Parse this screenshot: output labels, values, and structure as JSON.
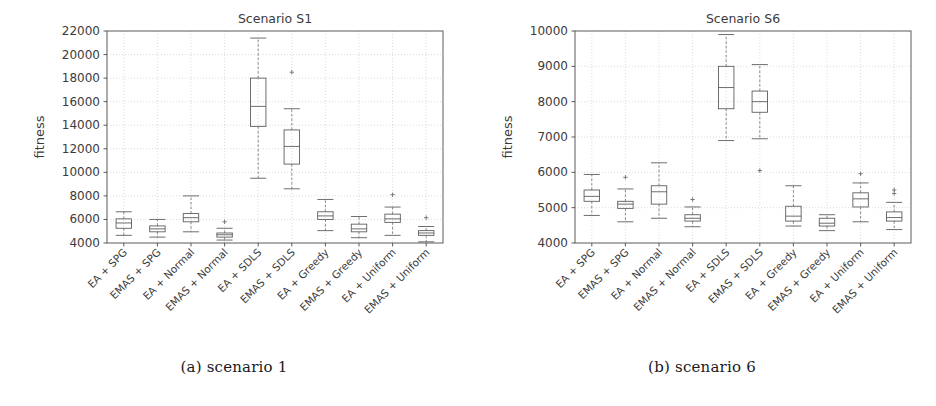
{
  "figure": {
    "panels": [
      {
        "id": "a",
        "caption": "(a) scenario 1",
        "chart_key": "0"
      },
      {
        "id": "b",
        "caption": "(b) scenario 6",
        "chart_key": "1"
      }
    ]
  },
  "chart_data": [
    {
      "type": "box",
      "title": "Scenario S1",
      "xlabel": "",
      "ylabel": "fitness",
      "ylim": [
        4000,
        22000
      ],
      "yticks": [
        4000,
        6000,
        8000,
        10000,
        12000,
        14000,
        16000,
        18000,
        20000,
        22000
      ],
      "ytick_labels": [
        "4000",
        "6000",
        "8000",
        "10000",
        "12000",
        "14000",
        "16000",
        "18000",
        "20000",
        "22000"
      ],
      "grid": true,
      "legend": "none",
      "categories": [
        "EA + SPG",
        "EMAS + SPG",
        "EA + Normal",
        "EMAS + Normal",
        "EA + SDLS",
        "EMAS + SDLS",
        "EA + Greedy",
        "EMAS + Greedy",
        "EA + Uniform",
        "EMAS + Uniform"
      ],
      "boxes": [
        {
          "category": "EA + SPG",
          "whisker_low": 4650,
          "q1": 5250,
          "median": 5700,
          "q3": 6050,
          "whisker_high": 6650,
          "outliers": []
        },
        {
          "category": "EMAS + SPG",
          "whisker_low": 4500,
          "q1": 4950,
          "median": 5200,
          "q3": 5450,
          "whisker_high": 6000,
          "outliers": []
        },
        {
          "category": "EA + Normal",
          "whisker_low": 4950,
          "q1": 5800,
          "median": 6150,
          "q3": 6500,
          "whisker_high": 8000,
          "outliers": []
        },
        {
          "category": "EMAS + Normal",
          "whisker_low": 4250,
          "q1": 4500,
          "median": 4700,
          "q3": 4850,
          "whisker_high": 5250,
          "outliers": [
            5800
          ]
        },
        {
          "category": "EA + SDLS",
          "whisker_low": 9500,
          "q1": 13900,
          "median": 15600,
          "q3": 18000,
          "whisker_high": 21400,
          "outliers": []
        },
        {
          "category": "EMAS + SDLS",
          "whisker_low": 8600,
          "q1": 10700,
          "median": 12200,
          "q3": 13600,
          "whisker_high": 15400,
          "outliers": [
            18500
          ]
        },
        {
          "category": "EA + Greedy",
          "whisker_low": 5050,
          "q1": 6000,
          "median": 6300,
          "q3": 6650,
          "whisker_high": 7700,
          "outliers": []
        },
        {
          "category": "EMAS + Greedy",
          "whisker_low": 4450,
          "q1": 4950,
          "median": 5200,
          "q3": 5600,
          "whisker_high": 6250,
          "outliers": []
        },
        {
          "category": "EA + Uniform",
          "whisker_low": 4650,
          "q1": 5750,
          "median": 6050,
          "q3": 6450,
          "whisker_high": 7050,
          "outliers": [
            8100
          ]
        },
        {
          "category": "EMAS + Uniform",
          "whisker_low": 4100,
          "q1": 4650,
          "median": 4850,
          "q3": 5050,
          "whisker_high": 5400,
          "outliers": [
            6150
          ]
        }
      ]
    },
    {
      "type": "box",
      "title": "Scenario S6",
      "xlabel": "",
      "ylabel": "fitness",
      "ylim": [
        4000,
        10000
      ],
      "yticks": [
        4000,
        5000,
        6000,
        7000,
        8000,
        9000,
        10000
      ],
      "ytick_labels": [
        "4000",
        "5000",
        "6000",
        "7000",
        "8000",
        "9000",
        "10000"
      ],
      "grid": true,
      "legend": "none",
      "categories": [
        "EA + SPG",
        "EMAS + SPG",
        "EA + Normal",
        "EMAS + Normal",
        "EA + SDLS",
        "EMAS + SDLS",
        "EA + Greedy",
        "EMAS + Greedy",
        "EA + Uniform",
        "EMAS + Uniform"
      ],
      "boxes": [
        {
          "category": "EA + SPG",
          "whisker_low": 4780,
          "q1": 5180,
          "median": 5320,
          "q3": 5500,
          "whisker_high": 5940,
          "outliers": []
        },
        {
          "category": "EMAS + SPG",
          "whisker_low": 4600,
          "q1": 4980,
          "median": 5100,
          "q3": 5180,
          "whisker_high": 5530,
          "outliers": [
            5860
          ]
        },
        {
          "category": "EA + Normal",
          "whisker_low": 4700,
          "q1": 5100,
          "median": 5450,
          "q3": 5620,
          "whisker_high": 6270,
          "outliers": []
        },
        {
          "category": "EMAS + Normal",
          "whisker_low": 4460,
          "q1": 4620,
          "median": 4700,
          "q3": 4800,
          "whisker_high": 5020,
          "outliers": [
            5230
          ]
        },
        {
          "category": "EA + SDLS",
          "whisker_low": 6900,
          "q1": 7800,
          "median": 8400,
          "q3": 9000,
          "whisker_high": 9900,
          "outliers": []
        },
        {
          "category": "EMAS + SDLS",
          "whisker_low": 6950,
          "q1": 7700,
          "median": 8000,
          "q3": 8300,
          "whisker_high": 9050,
          "outliers": [
            6050
          ]
        },
        {
          "category": "EA + Greedy",
          "whisker_low": 4480,
          "q1": 4620,
          "median": 4760,
          "q3": 5040,
          "whisker_high": 5620,
          "outliers": []
        },
        {
          "category": "EMAS + Greedy",
          "whisker_low": 4350,
          "q1": 4480,
          "median": 4560,
          "q3": 4700,
          "whisker_high": 4800,
          "outliers": []
        },
        {
          "category": "EA + Uniform",
          "whisker_low": 4600,
          "q1": 5020,
          "median": 5250,
          "q3": 5420,
          "whisker_high": 5700,
          "outliers": [
            5960
          ]
        },
        {
          "category": "EMAS + Uniform",
          "whisker_low": 4380,
          "q1": 4620,
          "median": 4720,
          "q3": 4880,
          "whisker_high": 5150,
          "outliers": [
            5400,
            5500
          ]
        }
      ]
    }
  ]
}
